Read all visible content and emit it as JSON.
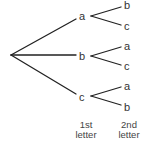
{
  "diagram": {
    "type": "tree",
    "root": "",
    "first_level": [
      {
        "label": "a",
        "children": [
          "b",
          "c"
        ]
      },
      {
        "label": "b",
        "children": [
          "a",
          "c"
        ]
      },
      {
        "label": "c",
        "children": [
          "a",
          "b"
        ]
      }
    ],
    "captions": {
      "level1_line1": "1st",
      "level1_line2": "letter",
      "level2_line1": "2nd",
      "level2_line2": "letter"
    },
    "line_color": "#222222",
    "text_color": "#333333"
  }
}
